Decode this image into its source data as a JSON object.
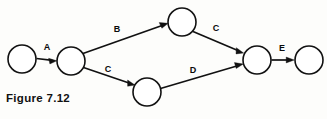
{
  "figure": {
    "caption": "Figure 7.12",
    "background_color": "#fdfdfb",
    "ink_color": "#111111",
    "width": 327,
    "height": 119
  },
  "diagram": {
    "type": "activity-network",
    "node_radius": 14,
    "nodes": [
      {
        "id": "n1",
        "label": "",
        "cx": 22,
        "cy": 59
      },
      {
        "id": "n2",
        "label": "",
        "cx": 71,
        "cy": 61
      },
      {
        "id": "n3",
        "label": "",
        "cx": 182,
        "cy": 22
      },
      {
        "id": "n4",
        "label": "",
        "cx": 147,
        "cy": 92
      },
      {
        "id": "n5",
        "label": "",
        "cx": 257,
        "cy": 60
      },
      {
        "id": "n6",
        "label": "",
        "cx": 309,
        "cy": 60
      }
    ],
    "edges": [
      {
        "id": "e-a",
        "label": "A",
        "from": "n1",
        "to": "n2",
        "label_x": 47,
        "label_y": 48
      },
      {
        "id": "e-b",
        "label": "B",
        "from": "n2",
        "to": "n3",
        "label_x": 117,
        "label_y": 30
      },
      {
        "id": "e-c1",
        "label": "C",
        "from": "n3",
        "to": "n5",
        "label_x": 216,
        "label_y": 29
      },
      {
        "id": "e-c2",
        "label": "C",
        "from": "n2",
        "to": "n4",
        "label_x": 108,
        "label_y": 70
      },
      {
        "id": "e-d",
        "label": "D",
        "from": "n4",
        "to": "n5",
        "label_x": 193,
        "label_y": 71
      },
      {
        "id": "e-e",
        "label": "E",
        "from": "n5",
        "to": "n6",
        "label_x": 282,
        "label_y": 49
      }
    ]
  }
}
